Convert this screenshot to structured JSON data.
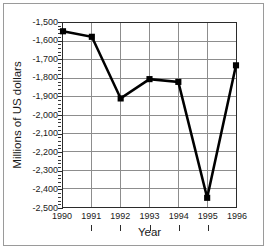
{
  "chart_data": {
    "type": "line",
    "title": "",
    "xlabel": "Year",
    "ylabel": "Millions of US dollars",
    "categories": [
      "1990",
      "1991",
      "1992",
      "1993",
      "1994",
      "1995",
      "1996"
    ],
    "x": [
      1990,
      1991,
      1992,
      1993,
      1994,
      1995,
      1996
    ],
    "values": [
      -1545,
      -1575,
      -1910,
      -1805,
      -1820,
      -2450,
      -1730
    ],
    "series": [
      {
        "name": "Balance",
        "values": [
          -1545,
          -1575,
          -1910,
          -1805,
          -1820,
          -2450,
          -1730
        ]
      }
    ],
    "xlim": [
      1990,
      1996
    ],
    "ylim": [
      -2500,
      -1500
    ],
    "ytick_values": [
      -1500,
      -1600,
      -1700,
      -1800,
      -1900,
      -2000,
      -2100,
      -2200,
      -2300,
      -2400,
      -2500
    ],
    "ytick_labels": [
      "-1,500",
      "-1,600",
      "-1,700",
      "-1,800",
      "-1,900",
      "-2,000",
      "-2,100",
      "-2,200",
      "-2,300",
      "-2,400",
      "-2,500"
    ],
    "xtick_labels": [
      "1990",
      "1991",
      "1992",
      "1993",
      "1994",
      "1995",
      "1996"
    ],
    "grid": true,
    "grid_axes": "both",
    "legend": false,
    "legend_position": "none",
    "minor_ticks_y": true,
    "marker": "square",
    "marker_color": "#000000",
    "line_color": "#000000",
    "line_width": 2.6,
    "grid_color": "#8c8c8c",
    "axis_color": "#2b2b2b",
    "background_color": "#ffffff",
    "frame_color": "#9a9a9a"
  }
}
